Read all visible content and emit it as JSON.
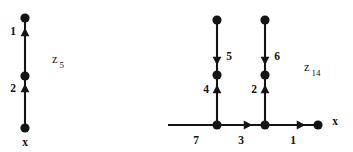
{
  "figure": {
    "background_color": "#ffffff",
    "ink_color": "#141414",
    "width": 353,
    "height": 152
  },
  "chart_data": {
    "type": "diagram",
    "title": "",
    "graphs": [
      {
        "id": "z5",
        "caption_base": "z",
        "caption_subscript": "5",
        "caption_x": 52,
        "caption_y": 60,
        "root_label": "x",
        "nodes": [
          {
            "name": "z5-node-top",
            "x": 25,
            "y": 18,
            "r": 4.6,
            "label": ""
          },
          {
            "name": "z5-node-middle",
            "x": 25,
            "y": 76,
            "r": 4.6,
            "label": ""
          },
          {
            "name": "z5-node-root",
            "x": 25,
            "y": 128,
            "r": 4.6,
            "label": "x"
          }
        ],
        "root_label_x": 25,
        "root_label_y": 143,
        "edges": [
          {
            "name": "z5-edge-1",
            "weight": "1",
            "x1": 25,
            "y1": 76,
            "x2": 25,
            "y2": 18,
            "direction": "up",
            "arrow_x": 25,
            "arrow_y": 32,
            "label_x": 13,
            "label_y": 32
          },
          {
            "name": "z5-edge-2",
            "weight": "2",
            "x1": 25,
            "y1": 128,
            "x2": 25,
            "y2": 76,
            "direction": "up",
            "arrow_x": 25,
            "arrow_y": 88,
            "label_x": 13,
            "label_y": 89
          }
        ]
      },
      {
        "id": "z14",
        "caption_base": "z",
        "caption_subscript": "14",
        "caption_x": 304,
        "caption_y": 68,
        "root_label": "x",
        "nodes": [
          {
            "name": "z14-node-left-top",
            "x": 217,
            "y": 20,
            "r": 4.6,
            "label": ""
          },
          {
            "name": "z14-node-left-middle",
            "x": 217,
            "y": 75,
            "r": 4.6,
            "label": ""
          },
          {
            "name": "z14-node-left-base",
            "x": 217,
            "y": 125,
            "r": 4.6,
            "label": ""
          },
          {
            "name": "z14-node-right-top",
            "x": 265,
            "y": 20,
            "r": 4.6,
            "label": ""
          },
          {
            "name": "z14-node-right-middle",
            "x": 265,
            "y": 75,
            "r": 4.6,
            "label": ""
          },
          {
            "name": "z14-node-right-base",
            "x": 265,
            "y": 125,
            "r": 4.6,
            "label": ""
          },
          {
            "name": "z14-node-root",
            "x": 318,
            "y": 125,
            "r": 4.6,
            "label": "x"
          }
        ],
        "root_label_x": 335,
        "root_label_y": 122,
        "edges": [
          {
            "name": "z14-edge-7",
            "weight": "7",
            "x1": 168,
            "y1": 125,
            "x2": 217,
            "y2": 125,
            "direction": "none",
            "arrow_x": 0,
            "arrow_y": 0,
            "label_x": 196,
            "label_y": 141
          },
          {
            "name": "z14-edge-3",
            "weight": "3",
            "x1": 217,
            "y1": 125,
            "x2": 265,
            "y2": 125,
            "direction": "right",
            "arrow_x": 248,
            "arrow_y": 125,
            "label_x": 241,
            "label_y": 141
          },
          {
            "name": "z14-edge-1",
            "weight": "1",
            "x1": 265,
            "y1": 125,
            "x2": 318,
            "y2": 125,
            "direction": "right",
            "arrow_x": 301,
            "arrow_y": 125,
            "label_x": 293,
            "label_y": 141
          },
          {
            "name": "z14-edge-5",
            "weight": "5",
            "x1": 217,
            "y1": 20,
            "x2": 217,
            "y2": 75,
            "direction": "down",
            "arrow_x": 217,
            "arrow_y": 61,
            "label_x": 229,
            "label_y": 57
          },
          {
            "name": "z14-edge-4",
            "weight": "4",
            "x1": 217,
            "y1": 125,
            "x2": 217,
            "y2": 75,
            "direction": "up",
            "arrow_x": 217,
            "arrow_y": 89,
            "label_x": 206,
            "label_y": 90
          },
          {
            "name": "z14-edge-6",
            "weight": "6",
            "x1": 265,
            "y1": 20,
            "x2": 265,
            "y2": 75,
            "direction": "down",
            "arrow_x": 265,
            "arrow_y": 61,
            "label_x": 277,
            "label_y": 57
          },
          {
            "name": "z14-edge-2",
            "weight": "2",
            "x1": 265,
            "y1": 125,
            "x2": 265,
            "y2": 75,
            "direction": "up",
            "arrow_x": 265,
            "arrow_y": 89,
            "label_x": 254,
            "label_y": 90
          }
        ]
      }
    ]
  }
}
